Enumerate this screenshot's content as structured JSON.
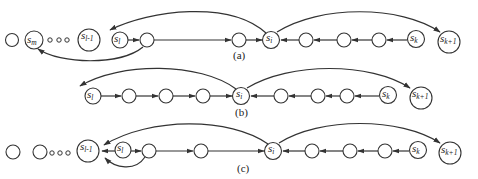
{
  "diagram": {
    "panels": [
      {
        "id": "a",
        "caption": "(a)",
        "labels": {
          "s_m": "m",
          "s_l_minus_1": "l-1",
          "s_l": "l",
          "s_i": "i",
          "s_k": "k",
          "s_k_plus_1": "k+1"
        }
      },
      {
        "id": "b",
        "caption": "(b)",
        "labels": {
          "s_l": "l",
          "s_i": "i",
          "s_k": "k",
          "s_k_plus_1": "k+1"
        }
      },
      {
        "id": "c",
        "caption": "(c)",
        "labels": {
          "s_l_minus_1": "l-1",
          "s_l": "l",
          "s_i": "i",
          "s_k": "k",
          "s_k_plus_1": "k+1"
        }
      }
    ],
    "symbol": "s",
    "colors": {
      "stroke": "#333333",
      "background": "#ffffff"
    }
  }
}
